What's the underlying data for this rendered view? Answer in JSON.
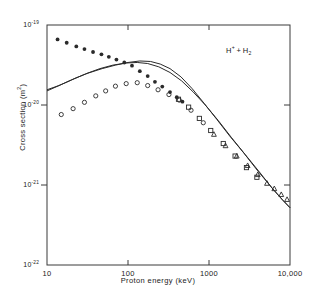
{
  "chart_data": {
    "type": "scatter",
    "title": "",
    "annotation": "H+ + H2",
    "xlabel": "Proton energy (keV)",
    "ylabel": "Cross section (m²)",
    "xscale": "log",
    "yscale": "log",
    "xlim": [
      10,
      10000
    ],
    "ylim": [
      1e-22,
      1e-19
    ],
    "grid": false,
    "legend": "none",
    "xticks": [
      {
        "value": 10,
        "label": "10"
      },
      {
        "value": 100,
        "label": "100"
      },
      {
        "value": 1000,
        "label": "1000"
      },
      {
        "value": 10000,
        "label": "10,000"
      }
    ],
    "yticks": [
      {
        "value": 1e-19,
        "label": "10-19",
        "mantissa": "10",
        "exponent": "-19"
      },
      {
        "value": 1e-20,
        "label": "10-20",
        "mantissa": "10",
        "exponent": "-20"
      },
      {
        "value": 1e-21,
        "label": "10-21",
        "mantissa": "10",
        "exponent": "-21"
      },
      {
        "value": 1e-22,
        "label": "10-22",
        "mantissa": "10",
        "exponent": "-22"
      }
    ],
    "series": [
      {
        "name": "filled-circles",
        "marker": "filled-circle",
        "points": [
          [
            13.5,
            6.6e-20
          ],
          [
            17.5,
            6e-20
          ],
          [
            23,
            5.4e-20
          ],
          [
            29,
            5e-20
          ],
          [
            37,
            4.6e-20
          ],
          [
            47,
            4.3e-20
          ],
          [
            58,
            4e-20
          ],
          [
            72,
            3.7e-20
          ],
          [
            90,
            3.4e-20
          ],
          [
            112,
            3.1e-20
          ],
          [
            140,
            2.65e-20
          ],
          [
            175,
            2.3e-20
          ],
          [
            215,
            1.95e-20
          ],
          [
            265,
            1.7e-20
          ],
          [
            330,
            1.45e-20
          ],
          [
            400,
            1.25e-20
          ],
          [
            470,
            1.1e-20
          ]
        ]
      },
      {
        "name": "open-circles",
        "marker": "open-circle",
        "points": [
          [
            15,
            7.6e-21
          ],
          [
            21,
            9e-21
          ],
          [
            29,
            1.08e-20
          ],
          [
            40,
            1.3e-20
          ],
          [
            53,
            1.5e-20
          ],
          [
            70,
            1.72e-20
          ],
          [
            95,
            1.85e-20
          ],
          [
            130,
            1.9e-20
          ],
          [
            175,
            1.75e-20
          ],
          [
            235,
            1.55e-20
          ],
          [
            320,
            1.35e-20
          ],
          [
            430,
            1.15e-20
          ],
          [
            600,
            8.6e-21
          ],
          [
            850,
            6e-21
          ]
        ]
      },
      {
        "name": "open-squares",
        "marker": "open-square",
        "points": [
          [
            420,
            1.18e-20
          ],
          [
            560,
            9.4e-21
          ],
          [
            760,
            6.8e-21
          ],
          [
            1050,
            4.8e-21
          ],
          [
            1500,
            3.3e-21
          ],
          [
            2100,
            2.3e-21
          ],
          [
            2900,
            1.65e-21
          ],
          [
            3900,
            1.25e-21
          ]
        ]
      },
      {
        "name": "open-triangles",
        "marker": "open-triangle",
        "points": [
          [
            1150,
            4.3e-21
          ],
          [
            1600,
            3.1e-21
          ],
          [
            2200,
            2.3e-21
          ],
          [
            3000,
            1.75e-21
          ],
          [
            4000,
            1.35e-21
          ],
          [
            5200,
            1.05e-21
          ],
          [
            6400,
            9e-22
          ],
          [
            7800,
            7.6e-22
          ],
          [
            9200,
            6.6e-22
          ]
        ]
      },
      {
        "name": "theory-curve-1",
        "marker": "line",
        "points": [
          [
            10,
            1.55e-20
          ],
          [
            14,
            1.75e-20
          ],
          [
            20,
            2.05e-20
          ],
          [
            30,
            2.45e-20
          ],
          [
            45,
            2.85e-20
          ],
          [
            65,
            3.15e-20
          ],
          [
            95,
            3.35e-20
          ],
          [
            130,
            3.4e-20
          ],
          [
            175,
            3.3e-20
          ],
          [
            240,
            3e-20
          ],
          [
            330,
            2.55e-20
          ],
          [
            460,
            2e-20
          ],
          [
            640,
            1.45e-20
          ],
          [
            900,
            1e-20
          ],
          [
            1300,
            6.4e-21
          ],
          [
            1900,
            3.9e-21
          ],
          [
            2800,
            2.4e-21
          ],
          [
            4200,
            1.45e-21
          ],
          [
            6200,
            8.8e-22
          ],
          [
            8200,
            6.4e-22
          ],
          [
            10000,
            5.2e-22
          ]
        ]
      },
      {
        "name": "theory-curve-2",
        "marker": "line",
        "points": [
          [
            10,
            1.5e-20
          ],
          [
            15,
            1.8e-20
          ],
          [
            22,
            2.15e-20
          ],
          [
            32,
            2.5e-20
          ],
          [
            48,
            2.85e-20
          ],
          [
            70,
            3.15e-20
          ],
          [
            100,
            3.4e-20
          ],
          [
            140,
            3.55e-20
          ],
          [
            190,
            3.5e-20
          ],
          [
            250,
            3.25e-20
          ],
          [
            330,
            2.85e-20
          ],
          [
            450,
            2.25e-20
          ],
          [
            620,
            1.6e-20
          ],
          [
            870,
            1.05e-20
          ],
          [
            1250,
            6.6e-21
          ],
          [
            1800,
            4.1e-21
          ],
          [
            2700,
            2.5e-21
          ],
          [
            4000,
            1.5e-21
          ],
          [
            6000,
            9.2e-22
          ],
          [
            8000,
            6.6e-22
          ],
          [
            10000,
            5.2e-22
          ]
        ]
      }
    ]
  },
  "axes": {
    "frame_color": "#3a3a3a",
    "marker_color": "#2a2a2a"
  }
}
